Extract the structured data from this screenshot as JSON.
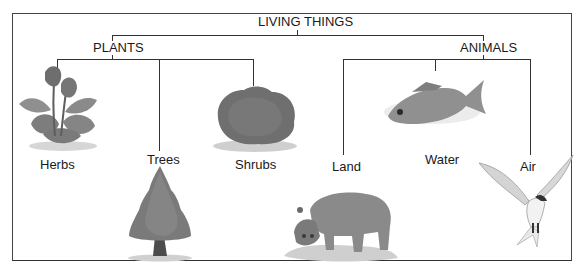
{
  "diagram": {
    "title": "LIVING THINGS",
    "groups": [
      {
        "label": "PLANTS",
        "children": [
          {
            "label": "Herbs",
            "illustration": "herb-plant"
          },
          {
            "label": "Trees",
            "illustration": "conifer-tree"
          },
          {
            "label": "Shrubs",
            "illustration": "shrub-bush"
          }
        ]
      },
      {
        "label": "ANIMALS",
        "children": [
          {
            "label": "Land",
            "illustration": "hippopotamus"
          },
          {
            "label": "Water",
            "illustration": "fish"
          },
          {
            "label": "Air",
            "illustration": "tern-bird"
          }
        ]
      }
    ],
    "colors": {
      "lines": "#333333",
      "frame": "#444444",
      "illustration_gray": "#8a8a8a"
    }
  }
}
